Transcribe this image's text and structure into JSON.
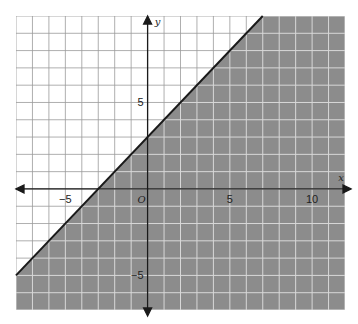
{
  "chart_data": {
    "type": "area",
    "title": "",
    "xlabel": "x",
    "ylabel": "y",
    "origin_label": "O",
    "xlim": [
      -8,
      12
    ],
    "ylim": [
      -7,
      10
    ],
    "grid": true,
    "x_tick_labels": [
      {
        "value": -5,
        "label": "−5"
      },
      {
        "value": 5,
        "label": "5"
      },
      {
        "value": 10,
        "label": "10"
      }
    ],
    "y_tick_labels": [
      {
        "value": 5,
        "label": "5"
      },
      {
        "value": -5,
        "label": "−5"
      }
    ],
    "boundary_line": {
      "slope": 1,
      "intercept": 3,
      "style": "solid",
      "points": [
        [
          -8,
          -5
        ],
        [
          7,
          10
        ]
      ]
    },
    "shaded_region": "below",
    "colors": {
      "shade": "#8c8c8c",
      "grid_unshaded": "#9a9a9a",
      "grid_shaded": "#d8d8d8",
      "line": "#1a1a1a",
      "axis": "#1a1a1a"
    }
  }
}
